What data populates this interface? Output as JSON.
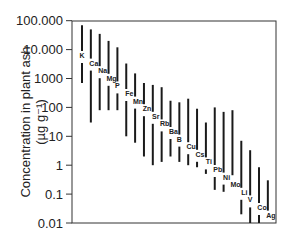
{
  "chart_data": {
    "type": "range-bar",
    "title": "",
    "xlabel": "",
    "ylabel": "Concentration in plant ash",
    "ylabel_units": "(µg g⁻¹)",
    "yscale": "log",
    "ylim": [
      0.01,
      100000
    ],
    "yticks": [
      100000,
      10000,
      1000,
      100,
      10,
      1,
      0.1,
      0.01
    ],
    "ytick_labels": [
      "100.000",
      "10.000",
      "1000",
      "100",
      "10",
      "1",
      "0.1",
      "0.01"
    ],
    "grid": false,
    "legend": null,
    "categories": [
      "K",
      "Ca",
      "Na",
      "Mg",
      "P",
      "Fe",
      "Mn",
      "Zn",
      "Sr",
      "Rb",
      "Ba",
      "B",
      "Cu",
      "Cs",
      "Ti",
      "Pb",
      "Ni",
      "Mo",
      "Li",
      "V",
      "Co",
      "Ag"
    ],
    "series": [
      {
        "name": "max",
        "values": [
          70000,
          50000,
          35000,
          20000,
          12000,
          3300,
          1500,
          700,
          600,
          500,
          170,
          150,
          200,
          90,
          30,
          100,
          70,
          80,
          7,
          3.3,
          0.85,
          0.3
        ]
      },
      {
        "name": "min",
        "values": [
          700,
          30,
          80,
          80,
          80,
          10,
          6,
          2,
          1,
          1.3,
          2,
          1.3,
          1,
          0.85,
          0.5,
          0.14,
          0.12,
          0.45,
          0.02,
          0.01,
          0.01,
          0.01
        ]
      }
    ]
  },
  "axis": {
    "ylabel_line1": "Concentration in plant ash",
    "ylabel_line2": "(µg g⁻¹)"
  }
}
